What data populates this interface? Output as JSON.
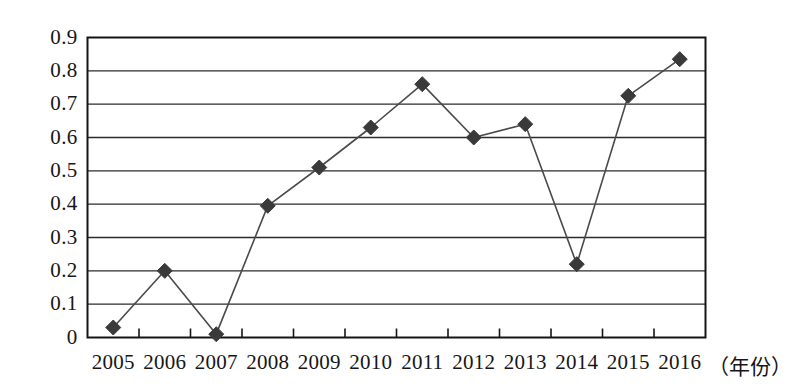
{
  "chart_data": {
    "type": "line",
    "title": "",
    "subtitle": "",
    "xlabel": "（年份）",
    "ylabel": "",
    "categories": [
      "2005",
      "2006",
      "2007",
      "2008",
      "2009",
      "2010",
      "2011",
      "2012",
      "2013",
      "2014",
      "2015",
      "2016"
    ],
    "values": [
      0.03,
      0.2,
      0.01,
      0.395,
      0.51,
      0.63,
      0.76,
      0.6,
      0.64,
      0.22,
      0.725,
      0.835
    ],
    "series": [
      {
        "name": "",
        "values": [
          0.03,
          0.2,
          0.01,
          0.395,
          0.51,
          0.63,
          0.76,
          0.6,
          0.64,
          0.22,
          0.725,
          0.835
        ]
      }
    ],
    "ylim": [
      0,
      0.9
    ],
    "ytick_labels": [
      "0.9",
      "0.8",
      "0.7",
      "0.6",
      "0.5",
      "0.4",
      "0.3",
      "0.2",
      "0.1",
      "0"
    ],
    "ytick_values": [
      0.9,
      0.8,
      0.7,
      0.6,
      0.5,
      0.4,
      0.3,
      0.2,
      0.1,
      0
    ],
    "xtick_labels": [
      "2005",
      "2006",
      "2007",
      "2008",
      "2009",
      "2010",
      "2011",
      "2012",
      "2013",
      "2014",
      "2015",
      "2016"
    ],
    "grid": "horizontal",
    "legend": "none",
    "marker": "diamond",
    "annotations": [],
    "colors": {
      "line": "#4a4a4a",
      "marker": "#3a3a3a",
      "grid": "#2b2b2b",
      "axis": "#141414",
      "background": "#ffffff",
      "text": "#161616"
    }
  },
  "axis_title": {
    "text": "（年份）"
  }
}
